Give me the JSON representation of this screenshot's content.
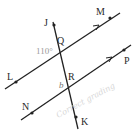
{
  "diagram": {
    "type": "parallel-lines-transversal",
    "points": {
      "J": "J",
      "K": "K",
      "L": "L",
      "M": "M",
      "N": "N",
      "P": "P",
      "Q": "Q",
      "R": "R"
    },
    "angle_label": "110°",
    "variable_label": "b",
    "handwritten_note": "Correct grading",
    "colors": {
      "line": "#222222",
      "angle_text": "#9a9a9a",
      "note": "#d8d8d8"
    }
  }
}
